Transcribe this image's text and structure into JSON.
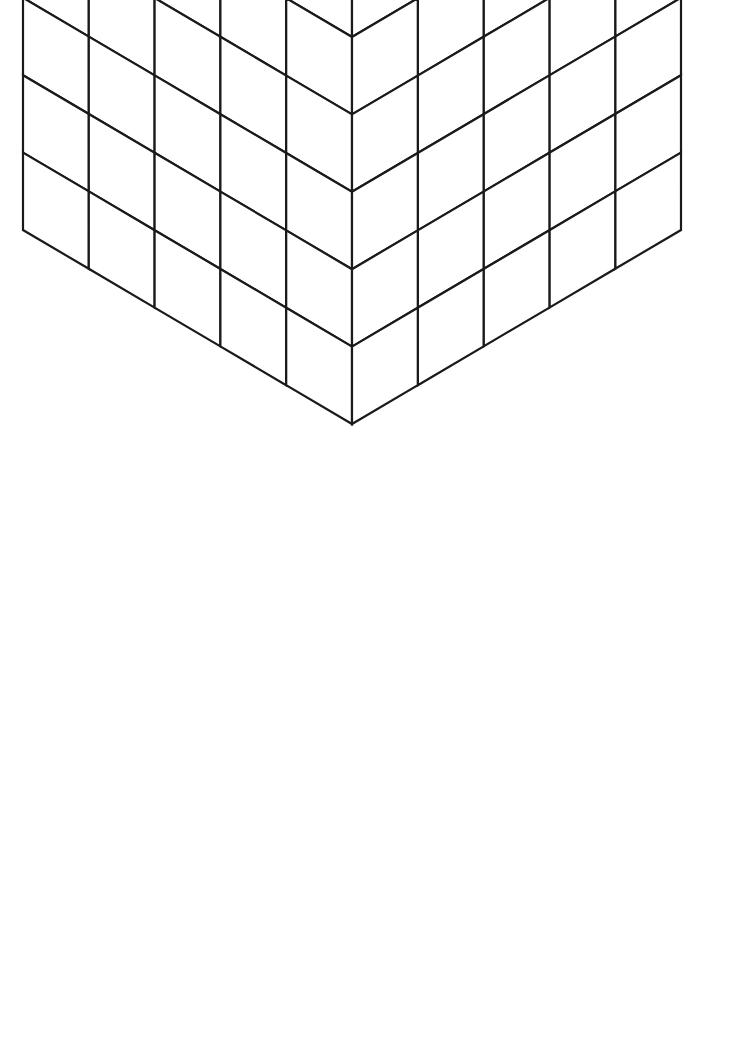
{
  "artwork": {
    "title": "Isometric Stacked Cubes Coloring Page",
    "description": "Line-art optical illusion drawing of a hollow rectangular block built from identical isometric cubes, forming a deep square recess on the top face and a matching recess on the bottom, with a single column of cubes rising in the centre.",
    "style": "black outline line art on white background",
    "line_color": "#1a1a1a",
    "fill_color": "#ffffff",
    "background_color": "#ffffff",
    "line_width": 2.2
  },
  "canvas": {
    "width": 736,
    "height": 1046
  },
  "geometry": {
    "origin_x": 352,
    "origin_y": 36,
    "half_width": 65.8,
    "half_depth": 38.8,
    "cube_height": 77.4,
    "grid_x": 5,
    "grid_y": 5,
    "grid_z": 7,
    "shell_thickness": 1,
    "well_depth": 3,
    "core_column": true,
    "extreme_points": {
      "top_apex": [
        352,
        36
      ],
      "left_corner": [
        23,
        230
      ],
      "right_corner": [
        680,
        230
      ],
      "left_bottom": [
        23,
        772
      ],
      "right_bottom": [
        680,
        772
      ],
      "bottom_apex": [
        352,
        978
      ]
    }
  },
  "voxel_model": {
    "note": "Occupancy is computed from the shell/well/core rules in geometry; x and y index the 5x5 footprint, z indexes 7 layers from bottom.",
    "shell_ring_cells": [
      [
        0,
        0
      ],
      [
        1,
        0
      ],
      [
        2,
        0
      ],
      [
        3,
        0
      ],
      [
        4,
        0
      ],
      [
        0,
        1
      ],
      [
        4,
        1
      ],
      [
        0,
        2
      ],
      [
        4,
        2
      ],
      [
        0,
        3
      ],
      [
        4,
        3
      ],
      [
        0,
        4
      ],
      [
        1,
        4
      ],
      [
        2,
        4
      ],
      [
        3,
        4
      ],
      [
        4,
        4
      ]
    ],
    "interior_cells": [
      [
        1,
        1
      ],
      [
        2,
        1
      ],
      [
        3,
        1
      ],
      [
        1,
        2
      ],
      [
        2,
        2
      ],
      [
        3,
        2
      ],
      [
        1,
        3
      ],
      [
        2,
        3
      ],
      [
        3,
        3
      ]
    ],
    "core_cell": [
      2,
      2
    ],
    "layers_total": 7,
    "top_well_layers": [
      4,
      5,
      6
    ],
    "bottom_well_layers": [
      0,
      1,
      2
    ],
    "middle_layer": 3
  },
  "face_types": {
    "top": "top-face",
    "left": "left-face",
    "right": "right-face"
  }
}
